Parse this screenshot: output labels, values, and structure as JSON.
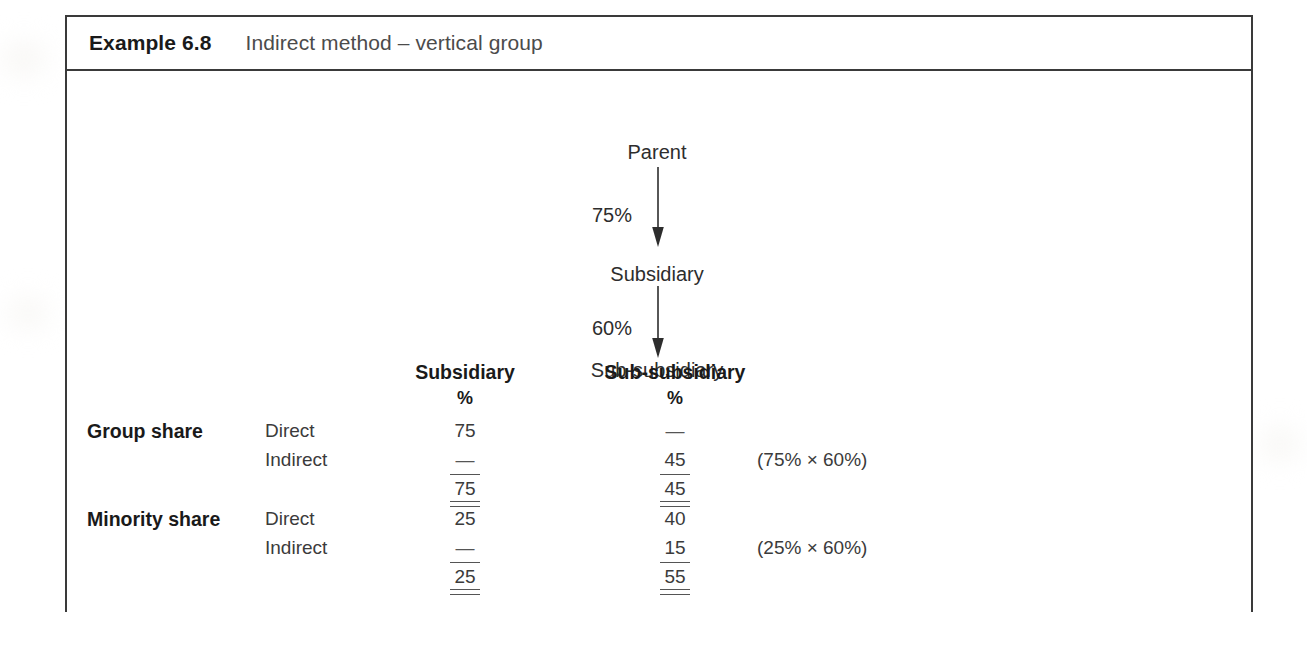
{
  "example": {
    "label": "Example 6.8",
    "title": "Indirect method – vertical group"
  },
  "diagram": {
    "nodes": {
      "parent": "Parent",
      "subsidiary": "Subsidiary",
      "sub_subsidiary": "Sub-subsidiary"
    },
    "edges": {
      "parent_to_subsidiary": "75%",
      "subsidiary_to_sub_subsidiary": "60%"
    }
  },
  "table": {
    "column_headers": {
      "subsidiary": "Subsidiary",
      "sub_subsidiary": "Sub-subsidiary",
      "unit_subsidiary": "%",
      "unit_sub_subsidiary": "%"
    },
    "sections": [
      {
        "label": "Group share",
        "rows": [
          {
            "kind": "Direct",
            "subsidiary": "75",
            "sub_subsidiary": "—",
            "note": ""
          },
          {
            "kind": "Indirect",
            "subsidiary": "—",
            "sub_subsidiary": "45",
            "note": "(75% × 60%)"
          }
        ],
        "total": {
          "subsidiary": "75",
          "sub_subsidiary": "45"
        }
      },
      {
        "label": "Minority share",
        "rows": [
          {
            "kind": "Direct",
            "subsidiary": "25",
            "sub_subsidiary": "40",
            "note": ""
          },
          {
            "kind": "Indirect",
            "subsidiary": "—",
            "sub_subsidiary": "15",
            "note": "(25% × 60%)"
          }
        ],
        "total": {
          "subsidiary": "25",
          "sub_subsidiary": "55"
        }
      }
    ]
  }
}
